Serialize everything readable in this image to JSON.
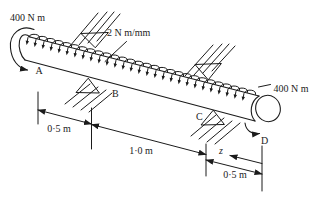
{
  "figure": {
    "type": "mechanics-diagram",
    "colors": {
      "ink": "#1b1b1b",
      "background": "#ffffff"
    },
    "labels": {
      "moment_left": "400 N m",
      "moment_right": "400 N m",
      "distributed_load": "2 N m/mm",
      "point_a": "A",
      "point_b": "B",
      "point_c": "C",
      "point_d": "D",
      "dim_ab": "0·5 m",
      "dim_bc": "1·0 m",
      "dim_cd": "0·5 m",
      "var_z": "z"
    },
    "distributed_arrows": {
      "count": 28,
      "start_x": 33,
      "spacing": 8
    }
  }
}
